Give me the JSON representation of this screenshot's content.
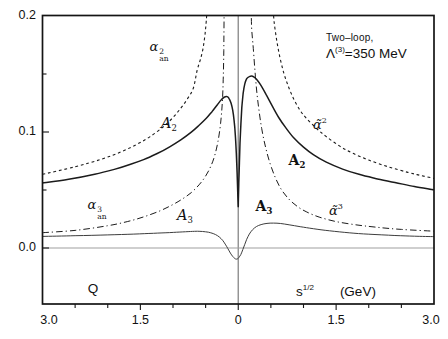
{
  "chart_data": {
    "type": "line",
    "title": "",
    "annotation": {
      "line1": "Two–loop,",
      "lambda": "Λ",
      "sup": "(3)",
      "value": "=350 MeV"
    },
    "x_axis": {
      "label_left": "Q",
      "label_right": {
        "base": "s",
        "sup": "1/2",
        "unit": "(GeV)"
      },
      "range": [
        -3,
        3
      ],
      "note": "negative side = spacelike Q (GeV), positive side = timelike s^1/2 (GeV)",
      "major_ticks": [
        -3,
        -1.5,
        0,
        1.5,
        3
      ],
      "tick_labels": [
        "3.0",
        "1.5",
        "0",
        "1.5",
        "3.0"
      ],
      "minor_step": 0.5
    },
    "y_axis": {
      "range": [
        -0.048,
        0.2
      ],
      "major_ticks": [
        0,
        0.1,
        0.2
      ],
      "tick_labels": [
        "0.0",
        "0.1",
        "0.2"
      ],
      "minor_ticks": [
        0.05,
        0.15
      ],
      "grid": false
    },
    "reference_lines": {
      "vertical_x": 0,
      "horizontal_y": 0
    },
    "legend": "labels placed next to curves",
    "curve_labels": {
      "pert2_spacelike": {
        "base": "α",
        "sup": "2",
        "sub": "an"
      },
      "analytic2_spacelike": {
        "base": "A",
        "sub": "2"
      },
      "analytic2_timelike": {
        "base": "A",
        "sub": "2"
      },
      "pert2_timelike": {
        "base": "α̃",
        "sup": "2"
      },
      "pert3_spacelike": {
        "base": "α",
        "sup": "3",
        "sub": "an"
      },
      "analytic3_spacelike": {
        "base": "A",
        "sub": "3"
      },
      "analytic3_timelike": {
        "base": "A",
        "sub": "3"
      },
      "pert3_timelike": {
        "base": "α̃",
        "sup": "3"
      }
    },
    "series": [
      {
        "name": "alpha2_an_perturbative_spacelike",
        "style": {
          "dash": "dash",
          "width": 1.1,
          "color": "#1b1b1b"
        },
        "points": [
          [
            -3,
            0.0635
          ],
          [
            -2.5,
            0.07
          ],
          [
            -2.1,
            0.0765
          ],
          [
            -1.8,
            0.0828
          ],
          [
            -1.55,
            0.0895
          ],
          [
            -1.35,
            0.096
          ],
          [
            -1.15,
            0.1045
          ],
          [
            -1.0,
            0.1125
          ],
          [
            -0.88,
            0.1205
          ],
          [
            -0.78,
            0.1285
          ],
          [
            -0.69,
            0.1375
          ],
          [
            -0.63,
            0.153
          ],
          [
            -0.58,
            0.1625
          ],
          [
            -0.54,
            0.172
          ],
          [
            -0.51,
            0.184
          ],
          [
            -0.49,
            0.196
          ],
          [
            -0.475,
            0.21
          ]
        ]
      },
      {
        "name": "alphabar2_perturbative_timelike",
        "style": {
          "dash": "dash",
          "width": 1.1,
          "color": "#1b1b1b"
        },
        "points": [
          [
            0.53,
            0.21
          ],
          [
            0.55,
            0.195
          ],
          [
            0.59,
            0.179
          ],
          [
            0.64,
            0.164
          ],
          [
            0.7,
            0.1505
          ],
          [
            0.77,
            0.139
          ],
          [
            0.85,
            0.1285
          ],
          [
            0.95,
            0.1185
          ],
          [
            1.05,
            0.1115
          ],
          [
            1.2,
            0.103
          ],
          [
            1.35,
            0.096
          ],
          [
            1.55,
            0.088
          ],
          [
            1.75,
            0.0818
          ],
          [
            2.0,
            0.0758
          ],
          [
            2.3,
            0.07
          ],
          [
            2.6,
            0.0652
          ],
          [
            2.8,
            0.0625
          ],
          [
            3.0,
            0.06
          ]
        ]
      },
      {
        "name": "alpha3_an_perturbative_spacelike",
        "style": {
          "dash": "dashdot",
          "width": 1.0,
          "color": "#1b1b1b"
        },
        "points": [
          [
            -3,
            0.0132
          ],
          [
            -2.5,
            0.0152
          ],
          [
            -2.0,
            0.0192
          ],
          [
            -1.7,
            0.0228
          ],
          [
            -1.45,
            0.0268
          ],
          [
            -1.2,
            0.032
          ],
          [
            -1.0,
            0.0375
          ],
          [
            -0.85,
            0.0425
          ],
          [
            -0.72,
            0.0478
          ],
          [
            -0.6,
            0.0545
          ],
          [
            -0.5,
            0.062
          ],
          [
            -0.42,
            0.0705
          ],
          [
            -0.36,
            0.08
          ],
          [
            -0.31,
            0.092
          ],
          [
            -0.27,
            0.1075
          ],
          [
            -0.245,
            0.125
          ],
          [
            -0.23,
            0.145
          ],
          [
            -0.222,
            0.17
          ],
          [
            -0.216,
            0.21
          ]
        ]
      },
      {
        "name": "alphabar3_perturbative_timelike",
        "style": {
          "dash": "dashdot",
          "width": 1.0,
          "color": "#1b1b1b"
        },
        "points": [
          [
            0.198,
            0.21
          ],
          [
            0.205,
            0.19
          ],
          [
            0.23,
            0.172
          ],
          [
            0.27,
            0.143
          ],
          [
            0.31,
            0.122
          ],
          [
            0.36,
            0.103
          ],
          [
            0.42,
            0.0865
          ],
          [
            0.49,
            0.0725
          ],
          [
            0.57,
            0.0605
          ],
          [
            0.66,
            0.0505
          ],
          [
            0.77,
            0.0425
          ],
          [
            0.9,
            0.036
          ],
          [
            1.05,
            0.031
          ],
          [
            1.25,
            0.0265
          ],
          [
            1.5,
            0.0228
          ],
          [
            1.8,
            0.02
          ],
          [
            2.1,
            0.018
          ],
          [
            2.5,
            0.016
          ],
          [
            3.0,
            0.0145
          ]
        ]
      },
      {
        "name": "A2_analytic_spacelike_timelike",
        "style": {
          "dash": "solid",
          "width": 1.5,
          "color": "#1b1b1b"
        },
        "points": [
          [
            -3,
            0.056
          ],
          [
            -2.6,
            0.0592
          ],
          [
            -2.2,
            0.0636
          ],
          [
            -1.9,
            0.0678
          ],
          [
            -1.65,
            0.0722
          ],
          [
            -1.45,
            0.0762
          ],
          [
            -1.25,
            0.0812
          ],
          [
            -1.05,
            0.0872
          ],
          [
            -0.88,
            0.0932
          ],
          [
            -0.72,
            0.0998
          ],
          [
            -0.6,
            0.1058
          ],
          [
            -0.49,
            0.1118
          ],
          [
            -0.4,
            0.1178
          ],
          [
            -0.32,
            0.1235
          ],
          [
            -0.26,
            0.1278
          ],
          [
            -0.21,
            0.1302
          ],
          [
            -0.17,
            0.1305
          ],
          [
            -0.14,
            0.1288
          ],
          [
            -0.11,
            0.1248
          ],
          [
            -0.085,
            0.1188
          ],
          [
            -0.063,
            0.1098
          ],
          [
            -0.045,
            0.0975
          ],
          [
            -0.03,
            0.082
          ],
          [
            -0.018,
            0.065
          ],
          [
            -0.009,
            0.049
          ],
          [
            -0.003,
            0.0385
          ],
          [
            0,
            0.0358
          ],
          [
            0.003,
            0.042
          ],
          [
            0.009,
            0.056
          ],
          [
            0.017,
            0.073
          ],
          [
            0.027,
            0.0905
          ],
          [
            0.04,
            0.107
          ],
          [
            0.055,
            0.121
          ],
          [
            0.075,
            0.133
          ],
          [
            0.1,
            0.1415
          ],
          [
            0.13,
            0.146
          ],
          [
            0.17,
            0.1478
          ],
          [
            0.22,
            0.148
          ],
          [
            0.28,
            0.1455
          ],
          [
            0.35,
            0.14
          ],
          [
            0.43,
            0.132
          ],
          [
            0.52,
            0.1225
          ],
          [
            0.62,
            0.1125
          ],
          [
            0.73,
            0.1035
          ],
          [
            0.85,
            0.095
          ],
          [
            1.0,
            0.087
          ],
          [
            1.15,
            0.0805
          ],
          [
            1.35,
            0.074
          ],
          [
            1.6,
            0.068
          ],
          [
            1.85,
            0.0635
          ],
          [
            2.1,
            0.06
          ],
          [
            2.4,
            0.0565
          ],
          [
            2.7,
            0.053
          ],
          [
            3.0,
            0.0502
          ]
        ]
      },
      {
        "name": "A3_analytic_spacelike_timelike",
        "style": {
          "dash": "solid",
          "width": 1.0,
          "color": "#3d3d3d"
        },
        "points": [
          [
            -3,
            0.01
          ],
          [
            -2.5,
            0.0106
          ],
          [
            -2.0,
            0.0113
          ],
          [
            -1.6,
            0.012
          ],
          [
            -1.3,
            0.0127
          ],
          [
            -1.05,
            0.0133
          ],
          [
            -0.85,
            0.0139
          ],
          [
            -0.7,
            0.0143
          ],
          [
            -0.6,
            0.0144
          ],
          [
            -0.5,
            0.014
          ],
          [
            -0.42,
            0.0131
          ],
          [
            -0.35,
            0.0116
          ],
          [
            -0.29,
            0.0095
          ],
          [
            -0.24,
            0.0066
          ],
          [
            -0.2,
            0.0034
          ],
          [
            -0.16,
            -0.0004
          ],
          [
            -0.12,
            -0.0044
          ],
          [
            -0.085,
            -0.0072
          ],
          [
            -0.055,
            -0.009
          ],
          [
            -0.03,
            -0.0096
          ],
          [
            -0.01,
            -0.0093
          ],
          [
            0.01,
            -0.0082
          ],
          [
            0.04,
            -0.0055
          ],
          [
            0.07,
            -0.0014
          ],
          [
            0.1,
            0.0032
          ],
          [
            0.13,
            0.0075
          ],
          [
            0.17,
            0.012
          ],
          [
            0.22,
            0.0158
          ],
          [
            0.28,
            0.0185
          ],
          [
            0.35,
            0.0202
          ],
          [
            0.44,
            0.0212
          ],
          [
            0.54,
            0.0215
          ],
          [
            0.65,
            0.0211
          ],
          [
            0.78,
            0.02
          ],
          [
            0.95,
            0.0184
          ],
          [
            1.15,
            0.0166
          ],
          [
            1.4,
            0.0148
          ],
          [
            1.7,
            0.0131
          ],
          [
            2.0,
            0.0119
          ],
          [
            2.4,
            0.0108
          ],
          [
            2.7,
            0.0102
          ],
          [
            3.0,
            0.0098
          ]
        ]
      }
    ]
  }
}
